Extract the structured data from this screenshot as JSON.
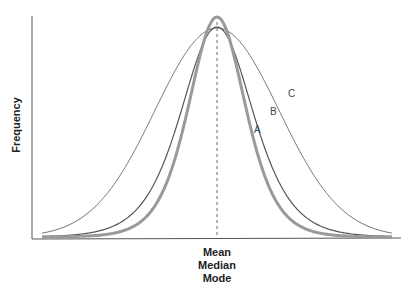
{
  "chart_data": {
    "type": "line",
    "title": "",
    "xlabel": [
      "Mean",
      "Median",
      "Mode"
    ],
    "ylabel": "Frequency",
    "center_marker": {
      "style": "dashed",
      "label": "Mean / Median / Mode"
    },
    "grid": false,
    "legend": "inline curve labels",
    "series": [
      {
        "name": "A",
        "label": "A",
        "description": "narrowest, tallest curve (thick gray)",
        "peak_relative": 1.0,
        "spread_relative": 0.55,
        "color": "#999999",
        "stroke_width": 3
      },
      {
        "name": "B",
        "label": "B",
        "description": "medium spread curve",
        "peak_relative": 0.95,
        "spread_relative": 0.75,
        "color": "#555555",
        "stroke_width": 1.2
      },
      {
        "name": "C",
        "label": "C",
        "description": "widest, flattest curve",
        "peak_relative": 0.95,
        "spread_relative": 1.0,
        "color": "#555555",
        "stroke_width": 0.8
      }
    ]
  },
  "labels": {
    "y_axis": "Frequency",
    "x_axis_lines": [
      "Mean",
      "Median",
      "Mode"
    ],
    "curve_a": "A",
    "curve_b": "B",
    "curve_c": "C"
  }
}
